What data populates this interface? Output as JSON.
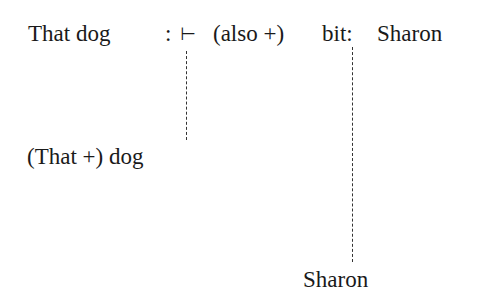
{
  "diagram": {
    "top_row": {
      "subject": "That dog",
      "colon": ":",
      "turnstile": "⊢",
      "modifier": "(also +)",
      "verb": "bit:",
      "object": "Sharon"
    },
    "subject_node": "(That +) dog",
    "object_node": "Sharon",
    "connectors": [
      {
        "from": "turnstile",
        "to": "subject_node",
        "style": "dashed"
      },
      {
        "from": "bit:",
        "to": "object_node",
        "style": "dashed"
      }
    ]
  }
}
